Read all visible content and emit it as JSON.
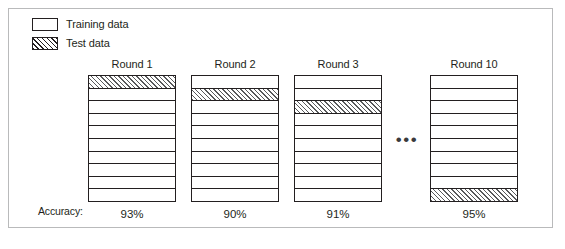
{
  "figure": {
    "kind": "cross-validation-diagram",
    "legend": {
      "items": [
        {
          "label": "Training data",
          "swatch": "empty-box",
          "fill": "#ffffff"
        },
        {
          "label": "Test data",
          "swatch": "hatched-box",
          "fill": "#ffffff"
        }
      ]
    },
    "accuracy_label": "Accuracy:",
    "ellipsis": "•••",
    "folds": 10,
    "rounds": [
      {
        "title": "Round 1",
        "test_fold_index": 1,
        "accuracy": "93%",
        "x": 88
      },
      {
        "title": "Round 2",
        "test_fold_index": 2,
        "accuracy": "90%",
        "x": 191
      },
      {
        "title": "Round 3",
        "test_fold_index": 3,
        "accuracy": "91%",
        "x": 294
      },
      {
        "title": "Round 10",
        "test_fold_index": 10,
        "accuracy": "95%",
        "x": 430
      }
    ],
    "colors": {
      "ink": "#231f20",
      "frame": "#b9babb",
      "hatch": "#58595b",
      "background": "#ffffff"
    }
  }
}
